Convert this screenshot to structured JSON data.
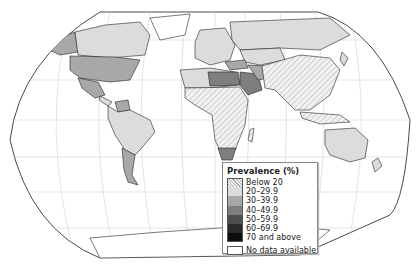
{
  "map": {
    "type": "choropleth",
    "projection": "Robinson-like world map",
    "subject": "Prevalence (%)",
    "regions_shaded": {
      "north_america_usa": "30-39.9",
      "alaska": "30-39.9",
      "canada": "20-29.9",
      "greenland": "No data available",
      "mexico": "30-39.9",
      "south_america_mostly": "20-29.9",
      "argentina": "30-39.9",
      "venezuela": "30-39.9",
      "europe_mostly": "20-29.9",
      "russia": "20-29.9",
      "north_africa_middle_east": "40-49.9",
      "egypt_saudi": "40-49.9",
      "sub_saharan_africa": "Below 20",
      "south_africa": "40-49.9",
      "china_india_se_asia": "Below 20",
      "australia": "20-29.9",
      "antarctica": "No data available"
    }
  },
  "legend": {
    "title": "Prevalence (%)",
    "items": [
      {
        "label": "Below 20",
        "color": "#eeeeee",
        "pattern": "hatched"
      },
      {
        "label": "20–29.9",
        "color": "#dcdcdc"
      },
      {
        "label": "30–39.9",
        "color": "#a8a8a8"
      },
      {
        "label": "40–49.9",
        "color": "#7e7e7e"
      },
      {
        "label": "50–59.9",
        "color": "#4e4e4e"
      },
      {
        "label": "60–69.9",
        "color": "#2a2a2a"
      },
      {
        "label": "70 and above",
        "color": "#0d0d0d"
      }
    ],
    "no_data": {
      "label": "No data available",
      "color": "#ffffff"
    }
  }
}
